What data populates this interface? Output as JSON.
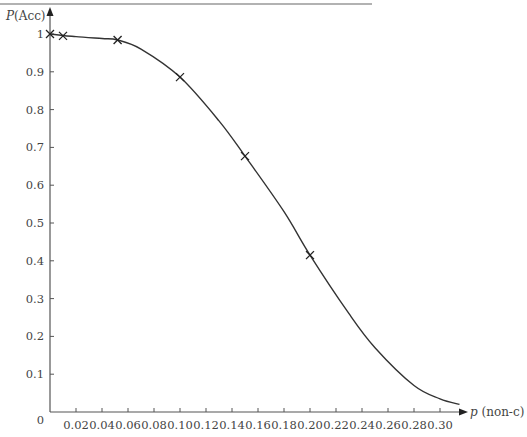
{
  "chart_data": {
    "type": "line",
    "title": "",
    "xlabel": "p (non-c)",
    "xlabel_var": "p",
    "xlabel_rest": " (non-c)",
    "ylabel": "P(Acc)",
    "ylabel_var": "P",
    "ylabel_rest": "(Acc)",
    "xlim": [
      0,
      0.315
    ],
    "ylim": [
      0,
      1.0
    ],
    "grid": false,
    "legend": null,
    "origin_label": "0",
    "x_ticks": [
      0.02,
      0.04,
      0.06,
      0.08,
      0.1,
      0.12,
      0.14,
      0.16,
      0.18,
      0.2,
      0.22,
      0.24,
      0.26,
      0.28,
      0.3
    ],
    "x_tick_labels": [
      "0.02",
      "0.04",
      "0.06",
      "0.08",
      "0.10",
      "0.12",
      "0.14",
      "0.16",
      "0.18",
      "0.20",
      "0.22",
      "0.24",
      "0.26",
      "0.28",
      "0.30"
    ],
    "y_ticks": [
      0.1,
      0.2,
      0.3,
      0.4,
      0.5,
      0.6,
      0.7,
      0.8,
      0.9,
      1.0
    ],
    "y_tick_labels": [
      "0.1",
      "0.2",
      "0.3",
      "0.4",
      "0.5",
      "0.6",
      "0.7",
      "0.8",
      "0.9",
      "1"
    ],
    "series": [
      {
        "name": "OC curve",
        "style": "smooth-line",
        "x": [
          0,
          0.01,
          0.02,
          0.04,
          0.052,
          0.07,
          0.1,
          0.13,
          0.15,
          0.18,
          0.2,
          0.23,
          0.25,
          0.28,
          0.3,
          0.315
        ],
        "values": [
          1.0,
          0.996,
          0.993,
          0.988,
          0.984,
          0.96,
          0.886,
          0.77,
          0.677,
          0.53,
          0.415,
          0.26,
          0.17,
          0.07,
          0.035,
          0.02
        ]
      },
      {
        "name": "Computed points",
        "style": "cross-markers",
        "x": [
          0,
          0.01,
          0.052,
          0.1,
          0.15,
          0.2
        ],
        "values": [
          1.0,
          0.995,
          0.984,
          0.886,
          0.677,
          0.415
        ]
      }
    ]
  },
  "colors": {
    "axis": "#555555",
    "curve": "#333333",
    "marker": "#222222",
    "text": "#444444",
    "top_rule": "#999999"
  }
}
